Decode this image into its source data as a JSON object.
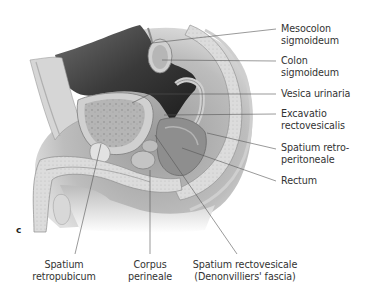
{
  "figure": {
    "panel_letter": "c",
    "right_labels": [
      {
        "id": "mesocolon",
        "lines": [
          "Mesocolon",
          "sigmoideum"
        ],
        "top": 23,
        "line_y": 29,
        "target": [
          152,
          43
        ]
      },
      {
        "id": "colon",
        "lines": [
          "Colon",
          "sigmoideum"
        ],
        "top": 54,
        "line_y": 61,
        "target": [
          162,
          60
        ]
      },
      {
        "id": "vesica",
        "lines": [
          "Vesica urinaria"
        ],
        "top": 88,
        "line_y": 94,
        "target": [
          132,
          103
        ]
      },
      {
        "id": "excavatio",
        "lines": [
          "Excavatio",
          "rectovesicalis"
        ],
        "top": 107,
        "line_y": 114,
        "target": [
          164,
          115
        ]
      },
      {
        "id": "spatium-retro",
        "lines": [
          "Spatium retro-",
          "peritoneale"
        ],
        "top": 141,
        "line_y": 148,
        "target": [
          207,
          133
        ]
      },
      {
        "id": "rectum",
        "lines": [
          "Rectum"
        ],
        "top": 175,
        "line_y": 181,
        "target": [
          182,
          148
        ]
      }
    ],
    "bottom_labels": [
      {
        "id": "spatium-retropubicum",
        "lines": [
          "Spatium",
          "retropubicum"
        ],
        "center_x": 64,
        "top": 259,
        "line_top": 252,
        "target": [
          100,
          143
        ]
      },
      {
        "id": "corpus-perineale",
        "lines": [
          "Corpus",
          "perineale"
        ],
        "center_x": 150,
        "top": 259,
        "line_top": 252,
        "target": [
          150,
          170
        ]
      },
      {
        "id": "spatium-rectovesicale",
        "lines": [
          "Spatium rectovesicale",
          "(Denonvilliers' fascia)"
        ],
        "center_x": 245,
        "top": 259,
        "line_top": 252,
        "target": [
          155,
          135
        ]
      }
    ]
  },
  "colors": {
    "leader_line": "#555555",
    "text": "#333333",
    "cavity_dark": "#2a2a2a",
    "tissue_light": "#d9d9d9",
    "tissue_mid": "#a8a8a8"
  }
}
